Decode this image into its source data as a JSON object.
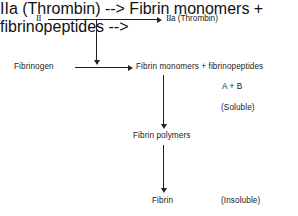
{
  "diagram": {
    "background_color": "#ffffff",
    "line_color": "#222222",
    "text_color": "#1a1a1a",
    "nodes": {
      "prothrombin": {
        "roman": "II",
        "suffix": ""
      },
      "thrombin": {
        "roman": "II",
        "suffix": "a (Thrombin)"
      },
      "fibrinogen": {
        "label": "Fibrinogen"
      },
      "fibrin_monomers": {
        "label": "Fibrin monomers + fibrinopeptides"
      },
      "fibrinopeptides_ab": {
        "label": "A + B"
      },
      "soluble": {
        "label": "(Soluble)"
      },
      "fibrin_polymers": {
        "label": "Fibrin polymers"
      },
      "fibrin": {
        "label": "Fibrin"
      },
      "insoluble": {
        "label": "(Insoluble)"
      }
    },
    "arrows": [
      {
        "name": "prothrombin-to-thrombin",
        "direction": "right"
      },
      {
        "name": "thrombin-catalysis-down",
        "direction": "down"
      },
      {
        "name": "fibrinogen-to-monomers",
        "direction": "right"
      },
      {
        "name": "monomers-to-polymers",
        "direction": "down"
      },
      {
        "name": "polymers-to-fibrin",
        "direction": "down"
      }
    ]
  }
}
